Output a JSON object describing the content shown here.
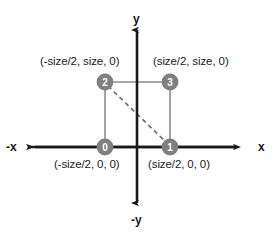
{
  "figure": {
    "background_color": "#ffffff",
    "axis_color": "#1a1a1a",
    "quad_stroke_color": "#8c8c8c",
    "node_fill_color": "#808080",
    "node_text_color": "#ffffff",
    "dashed_color": "#6e6e6e",
    "label_color": "#1a1a1a"
  },
  "axes": {
    "y_positive_label": "y",
    "y_negative_label": "-y",
    "x_positive_label": "x",
    "x_negative_label": "-x"
  },
  "vertices": [
    {
      "index": "0",
      "coordinate_label": "(-size/2, 0, 0)",
      "corner": "bottom-left",
      "x": -0.5,
      "y": 0,
      "z": 0
    },
    {
      "index": "1",
      "coordinate_label": "(size/2, 0, 0)",
      "corner": "bottom-right",
      "x": 0.5,
      "y": 0,
      "z": 0
    },
    {
      "index": "2",
      "coordinate_label": "(-size/2, size, 0)",
      "corner": "top-left",
      "x": -0.5,
      "y": 1,
      "z": 0
    },
    {
      "index": "3",
      "coordinate_label": "(size/2, size, 0)",
      "corner": "top-right",
      "x": 0.5,
      "y": 1,
      "z": 0
    }
  ],
  "diagonal": {
    "from_vertex": "2",
    "to_vertex": "1",
    "style": "dashed"
  }
}
